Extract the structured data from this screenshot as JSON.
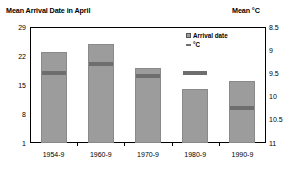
{
  "titles": {
    "left": "Mean Arrival Date in April",
    "right": "Mean °C"
  },
  "legend": {
    "items": [
      {
        "label": "Arrival date",
        "marker": "filled-square-swatch"
      },
      {
        "label": "°C",
        "marker": "dash-swatch"
      }
    ]
  },
  "colors": {
    "bar_fill": "#9c9c9c",
    "bar_stroke": "#8a8a8a",
    "marker": "#6e6e6e",
    "axis": "#000000",
    "background": "#ffffff"
  },
  "chart_data": {
    "type": "bar",
    "title": "Mean Arrival Date in April",
    "xlabel": "",
    "ylabel": "Mean Arrival Date in April",
    "y2label": "Mean °C",
    "grid": false,
    "legend_position": "top-right",
    "categories": [
      "1954-9",
      "1960-9",
      "1970-9",
      "1980-9",
      "1990-9"
    ],
    "ylim": [
      1,
      29
    ],
    "yticks": [
      29,
      22,
      15,
      8,
      1
    ],
    "y2lim": [
      8.5,
      11
    ],
    "y2ticks": [
      8.5,
      9,
      9.5,
      10,
      10.5,
      11
    ],
    "y2_inverted": true,
    "series": [
      {
        "name": "Arrival date",
        "axis": "left",
        "kind": "bar",
        "values": [
          23,
          25,
          19,
          14,
          16
        ]
      },
      {
        "name": "°C",
        "axis": "right",
        "kind": "marker",
        "values": [
          9.5,
          9.3,
          9.55,
          9.5,
          10.25
        ]
      }
    ]
  }
}
